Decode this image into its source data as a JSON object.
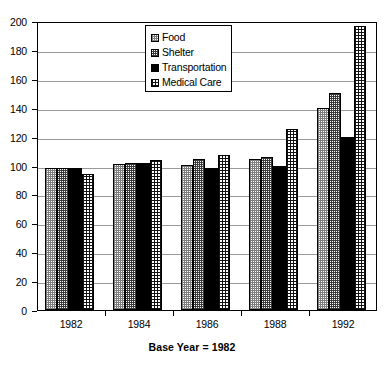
{
  "chart_data": {
    "type": "bar",
    "title": "",
    "xlabel": "Base Year = 1982",
    "ylabel": "",
    "ylim": [
      0,
      200
    ],
    "ytick_step": 20,
    "yticks": [
      0,
      20,
      40,
      60,
      80,
      100,
      120,
      140,
      160,
      180,
      200
    ],
    "grid": true,
    "legend_position": "top-center",
    "categories": [
      "1982",
      "1984",
      "1986",
      "1988",
      "1992"
    ],
    "series": [
      {
        "name": "Food",
        "pattern": "light-grid-dots",
        "values": [
          98,
          101,
          100.5,
          104.5,
          140
        ]
      },
      {
        "name": "Shelter",
        "pattern": "dark-grid-dots",
        "values": [
          98,
          101.5,
          104.5,
          106,
          150.5
        ]
      },
      {
        "name": "Transportation",
        "pattern": "solid-black",
        "values": [
          98,
          101.5,
          98,
          100,
          120
        ]
      },
      {
        "name": "Medical Care",
        "pattern": "cross-hatch",
        "values": [
          94,
          103.5,
          107,
          125.5,
          196.5
        ]
      }
    ]
  },
  "legend": {
    "items": [
      {
        "label": "Food"
      },
      {
        "label": "Shelter"
      },
      {
        "label": "Transportation"
      },
      {
        "label": "Medical Care"
      }
    ]
  },
  "axis": {
    "y_labels": [
      "200",
      "180",
      "160",
      "140",
      "120",
      "100",
      "80",
      "60",
      "40",
      "20",
      "0"
    ],
    "x_labels": [
      "1982",
      "1984",
      "1986",
      "1988",
      "1992"
    ],
    "x_title": "Base Year = 1982"
  }
}
